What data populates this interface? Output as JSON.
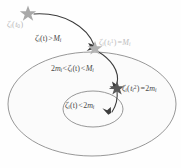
{
  "figure": {
    "name": "nested-region-trajectory-diagram",
    "background_color": "#fefefe",
    "width": 181,
    "height": 168
  },
  "regions": {
    "outer_ellipse": {
      "name": "outer-region",
      "stroke": "#808080",
      "fill": "#fbfbfb",
      "cx": 92,
      "cy": 104,
      "rx": 84,
      "ry": 52
    },
    "inner_ellipse": {
      "name": "inner-region",
      "stroke": "#808080",
      "fill": "#fbfbfb",
      "cx": 93,
      "cy": 109,
      "rx": 30,
      "ry": 18
    }
  },
  "markers": {
    "initial_star": {
      "label": "initial-state-star",
      "x": 28,
      "y": 13,
      "color": "#a8a8a8",
      "size": 9
    },
    "first_hit_star": {
      "label": "first-threshold-star",
      "x": 95,
      "y": 48,
      "color": "#b0b0b0",
      "size": 8
    },
    "second_hit_star": {
      "label": "second-threshold-star",
      "x": 117,
      "y": 88,
      "color": "#555555",
      "size": 8
    }
  },
  "labels": {
    "initial_condition": {
      "name": "initial-condition-label",
      "zeta": "ζ",
      "sub1": "i",
      "open": "(",
      "t": "t",
      "sub2": "0",
      "close": ")",
      "text": "ζᵢ(t₀)",
      "color": "#b9b9b9"
    },
    "above_M": {
      "name": "above-threshold-label",
      "zeta": "ζ",
      "sub1": "i",
      "arg": "(t)",
      "op": ">",
      "M": "M",
      "sub2": "i",
      "text": "ζᵢ(t) > Mᵢ",
      "color": "#4a4a4a"
    },
    "hit_M": {
      "name": "first-threshold-label",
      "zeta": "ζ",
      "sub1": "i",
      "open": "(",
      "t": "t",
      "sub_t": "i",
      "sup_t": "1",
      "close": ")",
      "op": "=",
      "M": "M",
      "sub2": "i",
      "text": "ζᵢ(tᵢ¹) = Mᵢ",
      "color": "#bdbdbd"
    },
    "between": {
      "name": "between-thresholds-label",
      "two": "2",
      "m": "m",
      "sub0": "i",
      "op1": "<",
      "zeta": "ζ",
      "sub1": "i",
      "arg": "(t)",
      "op2": "<",
      "M": "M",
      "sub2": "i",
      "text": "2mᵢ < ζᵢ(t) < Mᵢ",
      "color": "#4a4a4a"
    },
    "hit_2m": {
      "name": "second-threshold-label",
      "zeta": "ζ",
      "sub1": "i",
      "open": "(",
      "t": "t",
      "sub_t": "i",
      "sup_t": "2",
      "close": ")",
      "op": "=",
      "two": "2",
      "m": "m",
      "sub2": "i",
      "text": "ζᵢ(tᵢ²) = 2mᵢ",
      "color": "#4a4a4a"
    },
    "below_2m": {
      "name": "below-threshold-label",
      "zeta": "ζ",
      "sub1": "i",
      "arg": "(t)",
      "op": "<",
      "two": "2",
      "m": "m",
      "sub2": "i",
      "text": "ζᵢ(t) < 2mᵢ",
      "color": "#4a4a4a"
    }
  },
  "trajectory": {
    "name": "trajectory-path",
    "stroke": "#3d3d3d",
    "segments": [
      {
        "name": "segment-initial-to-first",
        "d": "M 33 14 C 62 13, 86 28, 94 46"
      },
      {
        "name": "segment-first-to-second",
        "d": "M 96 50 C 110 58, 119 70, 117 85"
      },
      {
        "name": "segment-second-into-inner",
        "d": "M 117 90 C 118 98, 116 105, 112 112"
      }
    ],
    "arrowheads": [
      {
        "name": "arrowhead-first",
        "x": 95,
        "y": 47,
        "angle": 65
      },
      {
        "name": "arrowhead-second",
        "x": 117,
        "y": 86,
        "angle": 92
      },
      {
        "name": "arrowhead-third",
        "x": 111,
        "y": 113,
        "angle": 122
      }
    ]
  }
}
